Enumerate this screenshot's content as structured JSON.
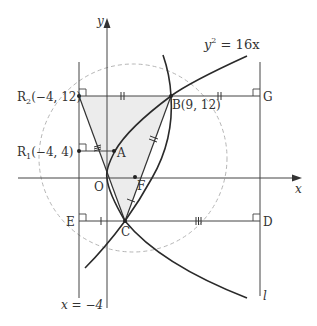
{
  "figure": {
    "equation_label": "y² = 16x",
    "equation_base": "y",
    "equation_exp": "2",
    "equation_rest": " = 16x",
    "axis_x_label": "x",
    "axis_y_label": "y",
    "directrix_label": "x = −4",
    "line_l_label": "l",
    "points": {
      "R2": {
        "name": "R",
        "sub": "2",
        "coords": "(−4, 12)"
      },
      "R1": {
        "name": "R",
        "sub": "1",
        "coords": "(−4, 4)"
      },
      "B": {
        "name": "B",
        "coords": "(9, 12)"
      },
      "A": {
        "name": "A"
      },
      "O": {
        "name": "O"
      },
      "F": {
        "name": "F"
      },
      "C": {
        "name": "C"
      },
      "E": {
        "name": "E"
      },
      "D": {
        "name": "D"
      },
      "G": {
        "name": "G"
      }
    }
  },
  "colors": {
    "line": "#444444",
    "curve": "#2a2a2a",
    "dashed_circle": "#b0b0b0",
    "shade": "#ececec"
  }
}
